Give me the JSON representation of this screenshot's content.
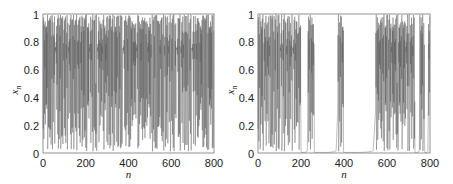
{
  "chart_data": [
    {
      "type": "line",
      "title": "",
      "xlabel": "n",
      "ylabel": "x_n",
      "xlim": [
        0,
        800
      ],
      "ylim": [
        0,
        1
      ],
      "xticks": [
        0,
        200,
        400,
        600,
        800
      ],
      "yticks": [
        0,
        0.2,
        0.4,
        0.6,
        0.8,
        1
      ],
      "ytick_labels": [
        "0",
        "0.2",
        "0.4",
        "0.6",
        "0.8",
        "1"
      ],
      "grid": false,
      "description": "Fully chaotic time series: x_n oscillates irregularly across [0,1] for all n from 0 to 800",
      "series": [
        {
          "name": "x_n",
          "regime": "chaotic",
          "seed": 7,
          "color": "#555555",
          "segments": [
            {
              "from": 0,
              "to": 800,
              "mode": "chaos"
            }
          ]
        }
      ]
    },
    {
      "type": "line",
      "title": "",
      "xlabel": "n",
      "ylabel": "x_n",
      "xlim": [
        0,
        800
      ],
      "ylim": [
        0,
        1
      ],
      "xticks": [
        0,
        200,
        400,
        600,
        800
      ],
      "yticks": [
        0,
        0.2,
        0.4,
        0.6,
        0.8,
        1
      ],
      "ytick_labels": [
        "0",
        "0.2",
        "0.4",
        "0.6",
        "0.8",
        "1"
      ],
      "grid": false,
      "description": "Intermittent time series: chaotic bursts separated by laminar phases near x_n = 0",
      "series": [
        {
          "name": "x_n",
          "regime": "intermittent",
          "seed": 13,
          "color": "#555555",
          "segments": [
            {
              "from": 0,
              "to": 200,
              "mode": "chaos"
            },
            {
              "from": 200,
              "to": 232,
              "mode": "laminar"
            },
            {
              "from": 232,
              "to": 262,
              "mode": "chaos"
            },
            {
              "from": 262,
              "to": 372,
              "mode": "laminar"
            },
            {
              "from": 372,
              "to": 398,
              "mode": "chaos"
            },
            {
              "from": 398,
              "to": 548,
              "mode": "laminar"
            },
            {
              "from": 548,
              "to": 730,
              "mode": "chaos"
            },
            {
              "from": 730,
              "to": 752,
              "mode": "laminar"
            },
            {
              "from": 752,
              "to": 775,
              "mode": "chaos"
            },
            {
              "from": 775,
              "to": 792,
              "mode": "laminar"
            },
            {
              "from": 792,
              "to": 800,
              "mode": "chaos"
            }
          ]
        }
      ]
    }
  ],
  "panels": [
    {
      "xlabel": "n",
      "ylabel": "x",
      "ylabel_sub": "n",
      "xtick_labels": [
        "0",
        "200",
        "400",
        "600",
        "800"
      ],
      "ytick_labels": [
        "0",
        "0.2",
        "0.4",
        "0.6",
        "0.8",
        "1"
      ]
    },
    {
      "xlabel": "n",
      "ylabel": "x",
      "ylabel_sub": "n",
      "xtick_labels": [
        "0",
        "200",
        "400",
        "600",
        "800"
      ],
      "ytick_labels": [
        "0",
        "0.2",
        "0.4",
        "0.6",
        "0.8",
        "1"
      ]
    }
  ]
}
